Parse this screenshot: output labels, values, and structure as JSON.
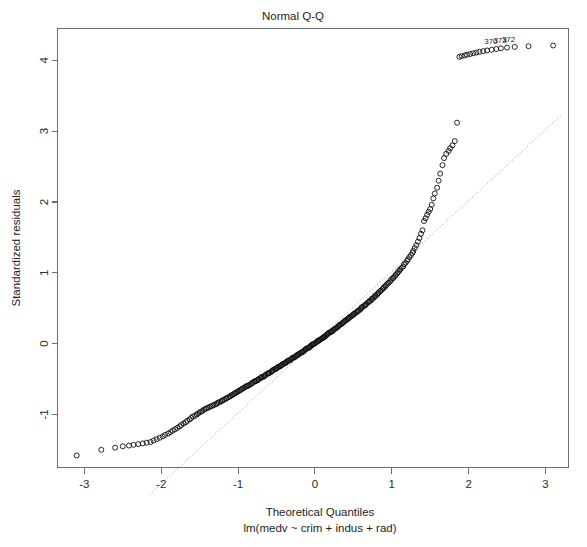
{
  "chart_data": {
    "type": "scatter",
    "title": "Normal Q-Q",
    "xlabel": "Theoretical Quantiles",
    "sublabel": "lm(medv ~ crim + indus + rad)",
    "ylabel": "Standardized residuals",
    "xlim": [
      -3.35,
      3.3
    ],
    "ylim": [
      -1.75,
      4.45
    ],
    "xticks": [
      -3,
      -2,
      -1,
      0,
      1,
      2,
      3
    ],
    "xtick_labels": [
      "-3",
      "-2",
      "-1",
      "0",
      "1",
      "2",
      "3"
    ],
    "yticks": [
      -1,
      0,
      1,
      2,
      3,
      4
    ],
    "ytick_labels": [
      "-1",
      "0",
      "1",
      "2",
      "3",
      "4"
    ],
    "grid": false,
    "legend": null,
    "point_marker": "open-circle",
    "point_color": "#111111",
    "reference_line": {
      "style": "dotted",
      "color": "#9a9a9a",
      "slope": 1.0,
      "intercept": 0.02,
      "x_from": -2.15,
      "x_to": 3.2
    },
    "annotations": [
      {
        "label": "370",
        "x": 2.29,
        "y": 4.17
      },
      {
        "label": "372",
        "x": 2.52,
        "y": 4.2
      },
      {
        "label": "373",
        "x": 2.41,
        "y": 4.19
      }
    ],
    "series": [
      {
        "name": "standardized residuals",
        "x": [
          -3.1,
          -2.78,
          -2.6,
          -2.5,
          -2.42,
          -2.36,
          -2.3,
          -2.24,
          -2.19,
          -2.14,
          -2.1,
          -2.06,
          -2.02,
          -1.98,
          -1.95,
          -1.91,
          -1.88,
          -1.85,
          -1.82,
          -1.79,
          -1.76,
          -1.74,
          -1.71,
          -1.68,
          -1.66,
          -1.63,
          -1.61,
          -1.59,
          -1.56,
          -1.54,
          -1.52,
          -1.5,
          -1.48,
          -1.46,
          -1.44,
          -1.42,
          -1.4,
          -1.38,
          -1.36,
          -1.34,
          -1.32,
          -1.3,
          -1.28,
          -1.27,
          -1.25,
          -1.23,
          -1.21,
          -1.2,
          -1.18,
          -1.16,
          -1.15,
          -1.13,
          -1.11,
          -1.1,
          -1.08,
          -1.07,
          -1.05,
          -1.04,
          -1.02,
          -1.01,
          -0.99,
          -0.98,
          -0.96,
          -0.95,
          -0.93,
          -0.92,
          -0.9,
          -0.89,
          -0.88,
          -0.86,
          -0.85,
          -0.83,
          -0.82,
          -0.81,
          -0.79,
          -0.78,
          -0.77,
          -0.75,
          -0.74,
          -0.73,
          -0.71,
          -0.7,
          -0.69,
          -0.67,
          -0.66,
          -0.65,
          -0.64,
          -0.62,
          -0.61,
          -0.6,
          -0.59,
          -0.57,
          -0.56,
          -0.55,
          -0.54,
          -0.52,
          -0.51,
          -0.5,
          -0.49,
          -0.48,
          -0.46,
          -0.45,
          -0.44,
          -0.43,
          -0.42,
          -0.4,
          -0.39,
          -0.38,
          -0.37,
          -0.36,
          -0.35,
          -0.33,
          -0.32,
          -0.31,
          -0.3,
          -0.29,
          -0.28,
          -0.26,
          -0.25,
          -0.24,
          -0.23,
          -0.22,
          -0.21,
          -0.2,
          -0.18,
          -0.17,
          -0.16,
          -0.15,
          -0.14,
          -0.13,
          -0.12,
          -0.11,
          -0.09,
          -0.08,
          -0.07,
          -0.06,
          -0.05,
          -0.04,
          -0.03,
          -0.02,
          -0.01,
          0.01,
          0.02,
          0.03,
          0.04,
          0.05,
          0.06,
          0.07,
          0.09,
          0.1,
          0.11,
          0.12,
          0.13,
          0.14,
          0.15,
          0.16,
          0.17,
          0.18,
          0.2,
          0.21,
          0.22,
          0.23,
          0.24,
          0.25,
          0.26,
          0.28,
          0.29,
          0.3,
          0.31,
          0.32,
          0.33,
          0.35,
          0.36,
          0.37,
          0.38,
          0.39,
          0.4,
          0.42,
          0.43,
          0.44,
          0.45,
          0.46,
          0.48,
          0.49,
          0.5,
          0.51,
          0.52,
          0.54,
          0.55,
          0.56,
          0.57,
          0.59,
          0.6,
          0.61,
          0.62,
          0.64,
          0.65,
          0.66,
          0.67,
          0.69,
          0.7,
          0.71,
          0.73,
          0.74,
          0.75,
          0.77,
          0.78,
          0.79,
          0.81,
          0.82,
          0.83,
          0.85,
          0.86,
          0.88,
          0.89,
          0.9,
          0.92,
          0.93,
          0.95,
          0.96,
          0.98,
          0.99,
          1.01,
          1.02,
          1.04,
          1.05,
          1.07,
          1.08,
          1.1,
          1.11,
          1.13,
          1.15,
          1.16,
          1.18,
          1.2,
          1.21,
          1.23,
          1.25,
          1.27,
          1.28,
          1.3,
          1.32,
          1.34,
          1.36,
          1.38,
          1.4,
          1.42,
          1.44,
          1.46,
          1.48,
          1.5,
          1.52,
          1.54,
          1.56,
          1.59,
          1.61,
          1.63,
          1.66,
          1.68,
          1.71,
          1.74,
          1.76,
          1.79,
          1.82,
          1.85,
          1.88,
          1.91,
          1.95,
          1.98,
          2.02,
          2.06,
          2.1,
          2.14,
          2.19,
          2.24,
          2.3,
          2.36,
          2.42,
          2.5,
          2.6,
          2.78,
          3.1
        ],
        "y": [
          -1.58,
          -1.5,
          -1.47,
          -1.45,
          -1.44,
          -1.43,
          -1.42,
          -1.41,
          -1.4,
          -1.39,
          -1.37,
          -1.35,
          -1.33,
          -1.31,
          -1.29,
          -1.27,
          -1.25,
          -1.23,
          -1.21,
          -1.19,
          -1.17,
          -1.15,
          -1.13,
          -1.11,
          -1.09,
          -1.07,
          -1.05,
          -1.03,
          -1.02,
          -1.0,
          -0.99,
          -0.97,
          -0.96,
          -0.95,
          -0.93,
          -0.92,
          -0.91,
          -0.9,
          -0.89,
          -0.88,
          -0.87,
          -0.86,
          -0.85,
          -0.84,
          -0.83,
          -0.82,
          -0.81,
          -0.8,
          -0.79,
          -0.78,
          -0.77,
          -0.76,
          -0.75,
          -0.74,
          -0.73,
          -0.72,
          -0.71,
          -0.7,
          -0.69,
          -0.68,
          -0.67,
          -0.66,
          -0.65,
          -0.64,
          -0.63,
          -0.62,
          -0.61,
          -0.6,
          -0.6,
          -0.59,
          -0.58,
          -0.57,
          -0.56,
          -0.55,
          -0.54,
          -0.53,
          -0.53,
          -0.52,
          -0.51,
          -0.5,
          -0.49,
          -0.48,
          -0.47,
          -0.47,
          -0.46,
          -0.45,
          -0.44,
          -0.43,
          -0.42,
          -0.42,
          -0.41,
          -0.4,
          -0.39,
          -0.38,
          -0.37,
          -0.36,
          -0.36,
          -0.35,
          -0.34,
          -0.33,
          -0.32,
          -0.32,
          -0.31,
          -0.3,
          -0.29,
          -0.28,
          -0.28,
          -0.27,
          -0.26,
          -0.25,
          -0.24,
          -0.24,
          -0.23,
          -0.22,
          -0.21,
          -0.2,
          -0.2,
          -0.19,
          -0.18,
          -0.17,
          -0.16,
          -0.16,
          -0.15,
          -0.14,
          -0.13,
          -0.12,
          -0.12,
          -0.11,
          -0.1,
          -0.09,
          -0.08,
          -0.07,
          -0.06,
          -0.06,
          -0.05,
          -0.04,
          -0.03,
          -0.02,
          -0.01,
          -0.01,
          0.0,
          0.01,
          0.02,
          0.03,
          0.04,
          0.04,
          0.05,
          0.06,
          0.07,
          0.08,
          0.09,
          0.09,
          0.1,
          0.11,
          0.12,
          0.13,
          0.14,
          0.15,
          0.16,
          0.17,
          0.17,
          0.18,
          0.19,
          0.2,
          0.21,
          0.22,
          0.23,
          0.24,
          0.25,
          0.26,
          0.27,
          0.28,
          0.29,
          0.3,
          0.31,
          0.32,
          0.33,
          0.34,
          0.35,
          0.36,
          0.37,
          0.38,
          0.39,
          0.4,
          0.41,
          0.42,
          0.43,
          0.44,
          0.45,
          0.46,
          0.47,
          0.48,
          0.5,
          0.51,
          0.52,
          0.53,
          0.54,
          0.55,
          0.56,
          0.58,
          0.59,
          0.6,
          0.61,
          0.63,
          0.64,
          0.65,
          0.67,
          0.68,
          0.69,
          0.71,
          0.72,
          0.74,
          0.75,
          0.77,
          0.78,
          0.8,
          0.81,
          0.83,
          0.85,
          0.86,
          0.88,
          0.9,
          0.92,
          0.93,
          0.95,
          0.97,
          0.99,
          1.01,
          1.03,
          1.05,
          1.07,
          1.09,
          1.12,
          1.14,
          1.17,
          1.19,
          1.22,
          1.25,
          1.28,
          1.31,
          1.35,
          1.39,
          1.44,
          1.49,
          1.55,
          1.6,
          1.73,
          1.77,
          1.82,
          1.86,
          1.9,
          1.96,
          2.05,
          2.12,
          2.2,
          2.3,
          2.4,
          2.52,
          2.62,
          2.68,
          2.72,
          2.76,
          2.8,
          2.86,
          3.12,
          4.05,
          4.06,
          4.07,
          4.08,
          4.09,
          4.1,
          4.11,
          4.12,
          4.13,
          4.14,
          4.15,
          4.16,
          4.17,
          4.18,
          4.19,
          4.2,
          4.21
        ]
      }
    ]
  }
}
